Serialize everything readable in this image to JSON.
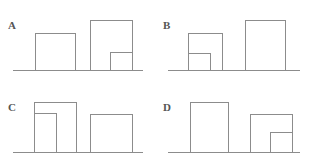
{
  "figure": {
    "width": 311,
    "height": 165,
    "background_color": "#ffffff",
    "stroke_color": "#8c8c8c",
    "label_color": "#555555",
    "stroke_width": 1.1
  },
  "chart_data": {
    "type": "diagram",
    "title": "",
    "panels": [
      {
        "label": "A",
        "label_x": 8,
        "label_y": 29,
        "baseline": {
          "x1": 13,
          "x2": 143,
          "y": 70
        },
        "shapes": [
          {
            "name": "left-rectangle",
            "x": 35,
            "y": 33,
            "width": 40,
            "height": 37,
            "inner": null
          },
          {
            "name": "right-rectangle",
            "x": 90,
            "y": 20,
            "width": 42,
            "height": 50,
            "inner": {
              "name": "inner-rectangle",
              "x": 110,
              "y": 52,
              "width": 22,
              "height": 18,
              "aligned": "right"
            }
          }
        ]
      },
      {
        "label": "B",
        "label_x": 163,
        "label_y": 29,
        "baseline": {
          "x1": 168,
          "x2": 300,
          "y": 70
        },
        "shapes": [
          {
            "name": "left-rectangle",
            "x": 188,
            "y": 33,
            "width": 34,
            "height": 37,
            "inner": {
              "name": "inner-rectangle",
              "x": 188,
              "y": 53,
              "width": 22,
              "height": 17,
              "aligned": "left"
            }
          },
          {
            "name": "right-rectangle",
            "x": 245,
            "y": 20,
            "width": 40,
            "height": 50,
            "inner": null
          }
        ]
      },
      {
        "label": "C",
        "label_x": 8,
        "label_y": 111,
        "baseline": {
          "x1": 13,
          "x2": 143,
          "y": 152
        },
        "shapes": [
          {
            "name": "left-rectangle",
            "x": 34,
            "y": 102,
            "width": 42,
            "height": 50,
            "inner": {
              "name": "inner-rectangle",
              "x": 34,
              "y": 113,
              "width": 22,
              "height": 39,
              "aligned": "left"
            }
          },
          {
            "name": "right-rectangle",
            "x": 90,
            "y": 114,
            "width": 42,
            "height": 38,
            "inner": null
          }
        ]
      },
      {
        "label": "D",
        "label_x": 163,
        "label_y": 111,
        "baseline": {
          "x1": 168,
          "x2": 300,
          "y": 152
        },
        "shapes": [
          {
            "name": "left-rectangle",
            "x": 190,
            "y": 102,
            "width": 38,
            "height": 50,
            "inner": null
          },
          {
            "name": "right-rectangle",
            "x": 250,
            "y": 114,
            "width": 42,
            "height": 38,
            "inner": {
              "name": "inner-rectangle",
              "x": 270,
              "y": 132,
              "width": 22,
              "height": 20,
              "aligned": "right"
            }
          }
        ]
      }
    ]
  }
}
